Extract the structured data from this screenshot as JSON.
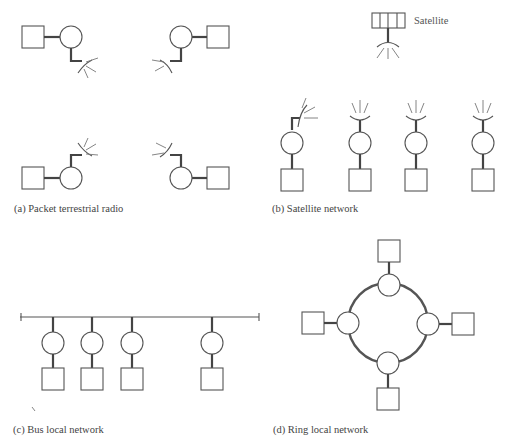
{
  "figure": {
    "panels": [
      {
        "id": "a",
        "caption": "(a) Packet terrestrial radio"
      },
      {
        "id": "b",
        "caption": "(b) Satellite network"
      },
      {
        "id": "c",
        "caption": "(c) Bus local network"
      },
      {
        "id": "d",
        "caption": "(d) Ring local network"
      }
    ],
    "satellite_label": "Satellite"
  },
  "colors": {
    "stroke": "#555555",
    "link": "#444444",
    "text": "#444444",
    "background": "#ffffff"
  },
  "packet_radio": {
    "stations": [
      {
        "square": [
          22,
          26
        ],
        "circle": [
          71,
          37
        ],
        "orientation": "down-right"
      },
      {
        "square": [
          207,
          26
        ],
        "circle": [
          181,
          37
        ],
        "orientation": "down-left"
      },
      {
        "square": [
          22,
          167
        ],
        "circle": [
          71,
          178
        ],
        "orientation": "up-right"
      },
      {
        "square": [
          207,
          167
        ],
        "circle": [
          181,
          178
        ],
        "orientation": "up-left"
      }
    ]
  },
  "satellite_network": {
    "satellite": {
      "x": 371,
      "y": 13,
      "segments": 4
    },
    "ground_stations": [
      {
        "x": 291,
        "tilted": true
      },
      {
        "x": 360,
        "tilted": false
      },
      {
        "x": 415,
        "tilted": false
      },
      {
        "x": 482,
        "tilted": false
      }
    ]
  },
  "bus_network": {
    "bus": {
      "x1": 20,
      "x2": 258,
      "y": 317
    },
    "stations_x": [
      53,
      92,
      132,
      212
    ]
  },
  "ring_network": {
    "center": [
      388,
      322
    ],
    "radius": 40,
    "stations": [
      "top",
      "right",
      "bottom",
      "left"
    ]
  }
}
